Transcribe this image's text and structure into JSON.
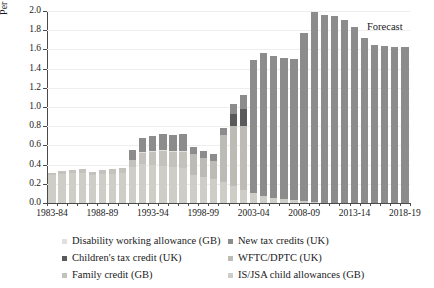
{
  "chart_data": {
    "type": "bar",
    "title": "",
    "subtitle": "",
    "xlabel": "",
    "ylabel": "Per cent of GDP",
    "ylim": [
      0.0,
      2.0
    ],
    "ytick_labels": [
      "0.0",
      "0.2",
      "0.4",
      "0.6",
      "0.8",
      "1.0",
      "1.2",
      "1.4",
      "1.6",
      "1.8",
      "2.0"
    ],
    "ytick_values": [
      0.0,
      0.2,
      0.4,
      0.6,
      0.8,
      1.0,
      1.2,
      1.4,
      1.6,
      1.8,
      2.0
    ],
    "grid": true,
    "stacked": true,
    "legend_position": "bottom",
    "annotations": [
      {
        "text": "Forecast",
        "x_category": "2016-17",
        "y": 1.84
      }
    ],
    "categories": [
      "1983-84",
      "1984-85",
      "1985-86",
      "1986-87",
      "1987-88",
      "1988-89",
      "1989-90",
      "1990-91",
      "1991-92",
      "1992-93",
      "1993-94",
      "1994-95",
      "1995-96",
      "1996-97",
      "1997-98",
      "1998-99",
      "1999-00",
      "2000-01",
      "2001-02",
      "2002-03",
      "2003-04",
      "2004-05",
      "2005-06",
      "2006-07",
      "2007-08",
      "2008-09",
      "2009-10",
      "2010-11",
      "2011-12",
      "2012-13",
      "2013-14",
      "2014-15",
      "2015-16",
      "2016-17",
      "2017-18",
      "2018-19"
    ],
    "xtick_labels": [
      "1983-84",
      "1988-89",
      "1993-94",
      "1998-99",
      "2003-04",
      "2008-09",
      "2013-14",
      "2018-19"
    ],
    "xtick_indices": [
      0,
      5,
      10,
      15,
      20,
      25,
      30,
      35
    ],
    "series": [
      {
        "name": "IS/JSA child allowances (GB)",
        "color": "#cfcdc8",
        "values": [
          0.29,
          0.3,
          0.31,
          0.31,
          0.29,
          0.3,
          0.3,
          0.31,
          0.38,
          0.41,
          0.4,
          0.39,
          0.37,
          0.36,
          0.29,
          0.27,
          0.25,
          0.22,
          0.18,
          0.14,
          0.1,
          0.07,
          0.05,
          0.04,
          0.03,
          0.02,
          0.01,
          0.0,
          0.0,
          0.0,
          0.0,
          0.0,
          0.0,
          0.0,
          0.0,
          0.0
        ]
      },
      {
        "name": "Family credit (GB)",
        "color": "#c4c2bd",
        "values": [
          0.02,
          0.03,
          0.03,
          0.04,
          0.03,
          0.04,
          0.05,
          0.05,
          0.07,
          0.11,
          0.13,
          0.15,
          0.16,
          0.17,
          0.0,
          0.0,
          0.0,
          0.0,
          0.0,
          0.0,
          0.0,
          0.0,
          0.0,
          0.0,
          0.0,
          0.0,
          0.0,
          0.0,
          0.0,
          0.0,
          0.0,
          0.0,
          0.0,
          0.0,
          0.0,
          0.0
        ]
      },
      {
        "name": "Disability working allowance (GB)",
        "color": "#e2e0dc",
        "values": [
          0.0,
          0.0,
          0.0,
          0.0,
          0.0,
          0.0,
          0.0,
          0.0,
          0.0,
          0.01,
          0.01,
          0.01,
          0.01,
          0.01,
          0.0,
          0.0,
          0.0,
          0.0,
          0.0,
          0.0,
          0.0,
          0.0,
          0.0,
          0.0,
          0.0,
          0.0,
          0.0,
          0.0,
          0.0,
          0.0,
          0.0,
          0.0,
          0.0,
          0.0,
          0.0,
          0.0
        ]
      },
      {
        "name": "WFTC/DPTC (UK)",
        "color": "#bdbbb6",
        "values": [
          0.0,
          0.0,
          0.0,
          0.0,
          0.0,
          0.0,
          0.0,
          0.0,
          0.0,
          0.0,
          0.0,
          0.0,
          0.0,
          0.0,
          0.22,
          0.2,
          0.19,
          0.49,
          0.62,
          0.66,
          0.0,
          0.0,
          0.0,
          0.0,
          0.0,
          0.0,
          0.0,
          0.0,
          0.0,
          0.0,
          0.0,
          0.0,
          0.0,
          0.0,
          0.0,
          0.0
        ]
      },
      {
        "name": "Children's tax credit (UK)",
        "color": "#5a5a5a",
        "values": [
          0.0,
          0.0,
          0.0,
          0.0,
          0.0,
          0.0,
          0.0,
          0.0,
          0.0,
          0.0,
          0.0,
          0.0,
          0.0,
          0.0,
          0.0,
          0.0,
          0.0,
          0.0,
          0.13,
          0.18,
          0.0,
          0.0,
          0.0,
          0.0,
          0.0,
          0.0,
          0.0,
          0.0,
          0.0,
          0.0,
          0.0,
          0.0,
          0.0,
          0.0,
          0.0,
          0.0
        ]
      },
      {
        "name": "New tax credits (UK)",
        "color": "#8c8c8c",
        "values": [
          0.0,
          0.0,
          0.0,
          0.0,
          0.0,
          0.0,
          0.0,
          0.0,
          0.1,
          0.15,
          0.16,
          0.17,
          0.17,
          0.18,
          0.07,
          0.07,
          0.07,
          0.07,
          0.1,
          0.15,
          1.39,
          1.49,
          1.48,
          1.47,
          1.47,
          1.75,
          1.98,
          1.96,
          1.95,
          1.91,
          1.83,
          1.72,
          1.65,
          1.64,
          1.63,
          1.62
        ]
      }
    ],
    "totals": [
      0.31,
      0.33,
      0.34,
      0.35,
      0.32,
      0.34,
      0.35,
      0.36,
      0.55,
      0.68,
      0.7,
      0.72,
      0.71,
      0.72,
      0.58,
      0.54,
      0.51,
      0.78,
      1.03,
      1.13,
      1.49,
      1.56,
      1.53,
      1.51,
      1.5,
      1.77,
      1.99,
      1.96,
      1.95,
      1.91,
      1.83,
      1.72,
      1.65,
      1.64,
      1.63,
      1.62
    ]
  },
  "legend": {
    "items": [
      {
        "label": "Disability working allowance (GB)",
        "color": "#e2e0dc",
        "name": "legend-disability-working-allowance"
      },
      {
        "label": "New tax credits (UK)",
        "color": "#8c8c8c",
        "name": "legend-new-tax-credits"
      },
      {
        "label": "Children's tax credit (UK)",
        "color": "#5a5a5a",
        "name": "legend-childrens-tax-credit"
      },
      {
        "label": "WFTC/DPTC (UK)",
        "color": "#bdbbb6",
        "name": "legend-wftc-dptc"
      },
      {
        "label": "Family credit (GB)",
        "color": "#c4c2bd",
        "name": "legend-family-credit"
      },
      {
        "label": "IS/JSA child allowances (GB)",
        "color": "#cfcdc8",
        "name": "legend-is-jsa-child-allowances"
      }
    ]
  },
  "colors": {
    "axis": "#4a4a4a",
    "grid": "#f0eeec",
    "text": "#1a1a1a",
    "background": "#ffffff"
  }
}
